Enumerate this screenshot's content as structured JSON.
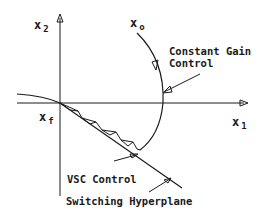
{
  "diagram": {
    "axes": {
      "x_label": "x",
      "x_subscript": "1",
      "y_label": "x",
      "y_subscript": "2"
    },
    "points": {
      "initial": {
        "label": "x",
        "subscript": "o"
      },
      "final": {
        "label": "x",
        "subscript": "f"
      }
    },
    "annotations": {
      "constant_gain_line1": "Constant Gain",
      "constant_gain_line2": "Control",
      "vsc_control": "VSC Control",
      "switching_hyperplane": "Switching Hyperplane"
    },
    "colors": {
      "stroke": "#1a1a1a",
      "background": "#ffffff"
    }
  }
}
